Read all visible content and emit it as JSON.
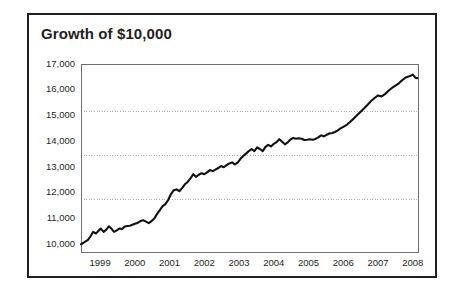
{
  "card": {
    "title": "Growth of $10,000",
    "border_color": "#231f20",
    "background": "#ffffff"
  },
  "chart_data": {
    "type": "line",
    "title": "Growth of $10,000",
    "xlabel": "",
    "ylabel": "",
    "grid": true,
    "gridlines_y": [
      11750,
      13450,
      15150
    ],
    "legend": null,
    "line_color": "#111111",
    "axis_color": "#6f6f6f",
    "grid_color": "#8a8a8a",
    "ylim": [
      9700,
      17000
    ],
    "xlim": [
      1998.45,
      2008.15
    ],
    "ytick_labels": [
      "17,000",
      "16,000",
      "15,000",
      "14,000",
      "13,000",
      "12,000",
      "11,000",
      "10,000"
    ],
    "yticks": [
      17000,
      16000,
      15000,
      14000,
      13000,
      12000,
      11000,
      10000
    ],
    "xtick_labels": [
      "1999",
      "2000",
      "2001",
      "2002",
      "2003",
      "2004",
      "2005",
      "2006",
      "2007",
      "2008"
    ],
    "xticks": [
      1999,
      2000,
      2001,
      2002,
      2003,
      2004,
      2005,
      2006,
      2007,
      2008
    ],
    "series": [
      {
        "name": "Growth of $10,000",
        "x": [
          1998.45,
          1998.55,
          1998.65,
          1998.72,
          1998.8,
          1998.88,
          1998.95,
          1999.02,
          1999.1,
          1999.18,
          1999.25,
          1999.33,
          1999.4,
          1999.48,
          1999.55,
          1999.63,
          1999.7,
          1999.78,
          1999.86,
          1999.93,
          2000.0,
          2000.08,
          2000.16,
          2000.24,
          2000.32,
          2000.4,
          2000.48,
          2000.56,
          2000.64,
          2000.72,
          2000.8,
          2000.88,
          2000.96,
          2001.04,
          2001.12,
          2001.2,
          2001.28,
          2001.36,
          2001.44,
          2001.52,
          2001.6,
          2001.68,
          2001.76,
          2001.84,
          2001.92,
          2002.0,
          2002.08,
          2002.16,
          2002.24,
          2002.32,
          2002.4,
          2002.48,
          2002.56,
          2002.64,
          2002.72,
          2002.8,
          2002.88,
          2002.96,
          2003.04,
          2003.12,
          2003.2,
          2003.28,
          2003.36,
          2003.44,
          2003.52,
          2003.6,
          2003.68,
          2003.76,
          2003.84,
          2003.92,
          2004.0,
          2004.08,
          2004.16,
          2004.24,
          2004.32,
          2004.4,
          2004.48,
          2004.56,
          2004.64,
          2004.72,
          2004.8,
          2004.88,
          2004.96,
          2005.04,
          2005.12,
          2005.2,
          2005.28,
          2005.36,
          2005.44,
          2005.52,
          2005.6,
          2005.68,
          2005.76,
          2005.84,
          2005.92,
          2006.0,
          2006.1,
          2006.2,
          2006.3,
          2006.4,
          2006.5,
          2006.6,
          2006.7,
          2006.8,
          2006.9,
          2007.0,
          2007.1,
          2007.2,
          2007.3,
          2007.4,
          2007.5,
          2007.6,
          2007.7,
          2007.8,
          2007.9,
          2008.0,
          2008.08,
          2008.13
        ],
        "y": [
          10000,
          10080,
          10170,
          10300,
          10480,
          10420,
          10520,
          10610,
          10480,
          10570,
          10700,
          10600,
          10480,
          10540,
          10610,
          10590,
          10680,
          10710,
          10720,
          10760,
          10800,
          10830,
          10900,
          10930,
          10880,
          10820,
          10900,
          11000,
          11180,
          11330,
          11480,
          11560,
          11720,
          11950,
          12100,
          12130,
          12060,
          12180,
          12330,
          12420,
          12560,
          12720,
          12620,
          12700,
          12760,
          12720,
          12790,
          12880,
          12840,
          12900,
          12960,
          13040,
          12990,
          13070,
          13140,
          13180,
          13100,
          13170,
          13320,
          13430,
          13520,
          13620,
          13700,
          13620,
          13760,
          13700,
          13620,
          13780,
          13860,
          13800,
          13900,
          13970,
          14080,
          13980,
          13880,
          13960,
          14070,
          14130,
          14100,
          14120,
          14100,
          14050,
          14060,
          14080,
          14060,
          14090,
          14150,
          14230,
          14190,
          14250,
          14300,
          14320,
          14360,
          14420,
          14500,
          14560,
          14640,
          14760,
          14880,
          15020,
          15150,
          15280,
          15420,
          15560,
          15680,
          15780,
          15740,
          15830,
          15960,
          16070,
          16160,
          16250,
          16380,
          16480,
          16520,
          16590,
          16460,
          16450
        ]
      }
    ]
  }
}
